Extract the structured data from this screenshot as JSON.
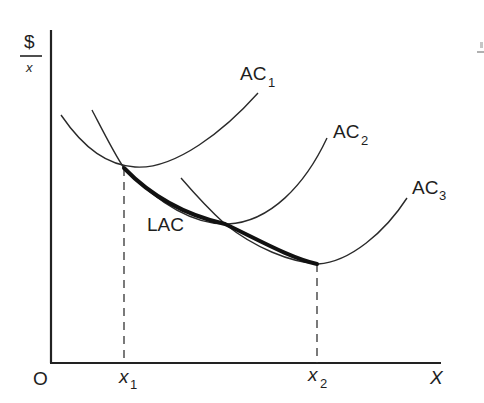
{
  "diagram": {
    "type": "cost-curves",
    "y_axis": {
      "label_top": "$",
      "label_bottom": "x"
    },
    "x_axis": {
      "label": "X",
      "origin": "O"
    },
    "ticks": [
      {
        "base": "x",
        "sub": "1"
      },
      {
        "base": "x",
        "sub": "2"
      }
    ],
    "curves": [
      {
        "id": "AC1",
        "base": "AC",
        "sub": "1"
      },
      {
        "id": "AC2",
        "base": "AC",
        "sub": "2"
      },
      {
        "id": "AC3",
        "base": "AC",
        "sub": "3"
      }
    ],
    "envelope": {
      "label": "LAC"
    },
    "colors": {
      "ink": "#222222",
      "background": "#ffffff"
    }
  }
}
